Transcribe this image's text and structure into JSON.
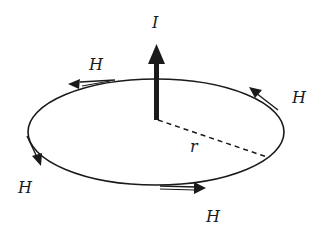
{
  "diagram": {
    "current_label": "I",
    "radius_label": "r",
    "field_labels": [
      "H",
      "H",
      "H",
      "H"
    ],
    "colors": {
      "stroke": "#1a1a1a",
      "background": "#ffffff"
    },
    "elements": {
      "wire_arrow": "upward thick arrow (current I)",
      "loop": "ellipse (circular field line in perspective)",
      "radius": "dashed line from wire to loop",
      "field_arrows": [
        "top-left pointing left",
        "top-right pointing up-left",
        "left pointing down-right",
        "bottom pointing right"
      ]
    }
  }
}
